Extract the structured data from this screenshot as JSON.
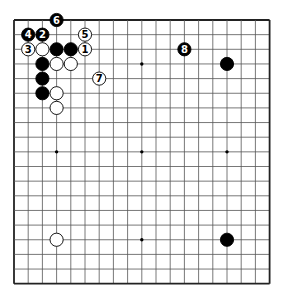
{
  "diagram": {
    "board_size": 19,
    "origin": {
      "x": 14,
      "y": 20
    },
    "spacing": {
      "x": 14.2,
      "y": 14.65
    },
    "colors": {
      "line": "#555555",
      "edge": "#222222",
      "black": "#000000",
      "white": "#ffffff"
    },
    "star_points": [
      [
        3,
        3
      ],
      [
        9,
        3
      ],
      [
        15,
        3
      ],
      [
        3,
        9
      ],
      [
        9,
        9
      ],
      [
        15,
        9
      ],
      [
        3,
        15
      ],
      [
        9,
        15
      ],
      [
        15,
        15
      ]
    ],
    "stones": [
      {
        "col": 3,
        "row": 0,
        "color": "black",
        "label": "6"
      },
      {
        "col": 1,
        "row": 1,
        "color": "black",
        "label": "4"
      },
      {
        "col": 2,
        "row": 1,
        "color": "black",
        "label": "2"
      },
      {
        "col": 5,
        "row": 1,
        "color": "white",
        "label": "5"
      },
      {
        "col": 1,
        "row": 2,
        "color": "white",
        "label": "3"
      },
      {
        "col": 2,
        "row": 2,
        "color": "white",
        "label": ""
      },
      {
        "col": 3,
        "row": 2,
        "color": "black",
        "label": ""
      },
      {
        "col": 4,
        "row": 2,
        "color": "black",
        "label": ""
      },
      {
        "col": 5,
        "row": 2,
        "color": "white",
        "label": "1"
      },
      {
        "col": 2,
        "row": 3,
        "color": "black",
        "label": ""
      },
      {
        "col": 3,
        "row": 3,
        "color": "white",
        "label": ""
      },
      {
        "col": 4,
        "row": 3,
        "color": "white",
        "label": ""
      },
      {
        "col": 2,
        "row": 4,
        "color": "black",
        "label": ""
      },
      {
        "col": 6,
        "row": 4,
        "color": "white",
        "label": "7"
      },
      {
        "col": 2,
        "row": 5,
        "color": "black",
        "label": ""
      },
      {
        "col": 3,
        "row": 5,
        "color": "white",
        "label": ""
      },
      {
        "col": 3,
        "row": 6,
        "color": "white",
        "label": ""
      },
      {
        "col": 12,
        "row": 2,
        "color": "black",
        "label": "8"
      },
      {
        "col": 15,
        "row": 3,
        "color": "black",
        "label": ""
      },
      {
        "col": 3,
        "row": 15,
        "color": "white",
        "label": ""
      },
      {
        "col": 15,
        "row": 15,
        "color": "black",
        "label": ""
      }
    ]
  }
}
